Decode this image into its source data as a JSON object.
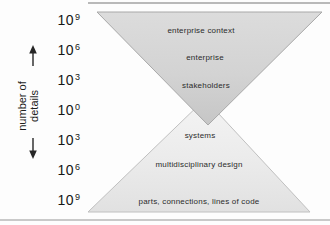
{
  "figure_title": "hourglass diagram of system hierarchy vs number of details",
  "y_axis": {
    "title_line1": "number of",
    "title_line2": "details",
    "arrow_up_icon": "up-arrow",
    "arrow_down_icon": "down-arrow",
    "arrow_color": "#262626",
    "ticks": [
      {
        "base": "10",
        "exp": "9"
      },
      {
        "base": "10",
        "exp": "6"
      },
      {
        "base": "10",
        "exp": "3"
      },
      {
        "base": "10",
        "exp": "0"
      },
      {
        "base": "10",
        "exp": "3"
      },
      {
        "base": "10",
        "exp": "6"
      },
      {
        "base": "10",
        "exp": "9"
      }
    ]
  },
  "top_triangle": {
    "orientation": "inverted",
    "levels": [
      "enterprise context",
      "enterprise",
      "stakeholders"
    ],
    "fill_top": "#dcdcdc",
    "fill_mid": "#d3d3d3",
    "fill_tip": "#c6c6c6",
    "stroke": "#a8a8a8"
  },
  "bottom_triangle": {
    "orientation": "upright",
    "levels": [
      "systems",
      "multidisciplinary design",
      "parts, connections, lines of code"
    ],
    "fill_top": "#f4f4f4",
    "fill_mid": "#ebebeb",
    "fill_bottom": "#e1e1e1",
    "stroke": "#c0c0c0"
  }
}
